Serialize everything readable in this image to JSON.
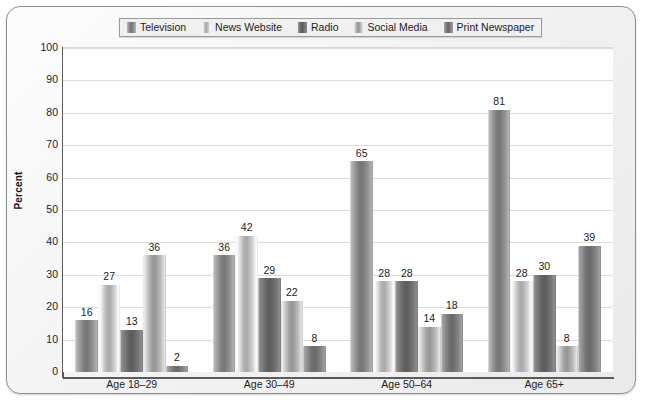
{
  "chart_data": {
    "type": "bar",
    "title": "",
    "xlabel": "",
    "ylabel": "Percent",
    "ylim": [
      0,
      100
    ],
    "ytick_step": 10,
    "yticks": [
      100,
      90,
      80,
      70,
      60,
      50,
      40,
      30,
      20,
      10,
      0
    ],
    "grid": true,
    "legend_position": "top-center",
    "categories": [
      "Age 18–29",
      "Age 30–49",
      "Age 50–64",
      "Age 65+"
    ],
    "series": [
      {
        "name": "Television",
        "values": [
          16,
          36,
          65,
          81
        ],
        "color": "#8c8c8c"
      },
      {
        "name": "News Website",
        "values": [
          27,
          42,
          28,
          28
        ],
        "color": "#c9c9c9"
      },
      {
        "name": "Radio",
        "values": [
          13,
          29,
          28,
          30
        ],
        "color": "#6e6e6e"
      },
      {
        "name": "Social Media",
        "values": [
          36,
          22,
          14,
          8
        ],
        "color": "#b3b3b3"
      },
      {
        "name": "Print Newspaper",
        "values": [
          2,
          8,
          18,
          39
        ],
        "color": "#7d7d7d"
      }
    ]
  }
}
